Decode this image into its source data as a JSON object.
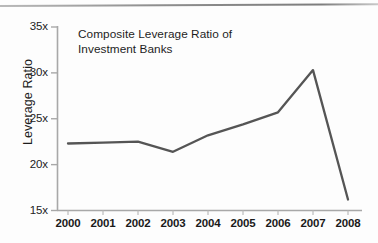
{
  "figure": {
    "background": "#fdfdfd",
    "rule_color": "#8f8f8f"
  },
  "chart_data": {
    "type": "line",
    "title": "Composite Leverage Ratio of Investment Banks",
    "title_line1": "Composite Leverage Ratio of",
    "title_line2": "Investment Banks",
    "xlabel": "",
    "ylabel": "Leverage Ratio",
    "x": [
      "2000",
      "2001",
      "2002",
      "2003",
      "2004",
      "2005",
      "2006",
      "2007",
      "2008"
    ],
    "categories": [
      "2000",
      "2001",
      "2002",
      "2003",
      "2004",
      "2005",
      "2006",
      "2007",
      "2008"
    ],
    "values": [
      22.3,
      22.4,
      22.5,
      21.4,
      23.2,
      24.4,
      25.7,
      30.3,
      16.2
    ],
    "series": [
      {
        "name": "Composite Leverage Ratio",
        "values": [
          22.3,
          22.4,
          22.5,
          21.4,
          23.2,
          24.4,
          25.7,
          30.3,
          16.2
        ]
      }
    ],
    "ylim": [
      15,
      35
    ],
    "yticks": [
      15,
      20,
      25,
      30,
      35
    ],
    "ytick_labels": [
      "15x",
      "20x",
      "25x",
      "30x",
      "35x"
    ],
    "xtick_labels": [
      "2000",
      "2001",
      "2002",
      "2003",
      "2004",
      "2005",
      "2006",
      "2007",
      "2008"
    ],
    "grid": false,
    "legend": false,
    "line_color": "#555555",
    "axis_color": "#a8a8a8"
  }
}
